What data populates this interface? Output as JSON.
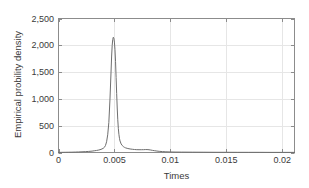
{
  "chart_data": {
    "type": "line",
    "title": "",
    "xlabel": "Times",
    "ylabel": "Empirical probility density",
    "xlim": [
      0,
      0.0211
    ],
    "ylim": [
      0,
      2500
    ],
    "xticks": [
      0,
      0.005,
      0.01,
      0.015,
      0.02
    ],
    "xticklabels": [
      "0",
      "0.005",
      "0.01",
      "0.015",
      "0.02"
    ],
    "yticks": [
      0,
      500,
      1000,
      1500,
      2000,
      2500
    ],
    "yticklabels": [
      "0",
      "500",
      "1,000",
      "1,500",
      "2,000",
      "2,500"
    ],
    "grid": true,
    "legend": null,
    "line_color": "#6e6e6e",
    "grid_color": "#e6e6e6",
    "axis_color": "#8c8c8c",
    "text_color": "#3a3a3a",
    "background": "#ffffff",
    "series": [
      {
        "name": "empirical density",
        "x": [
          0.0,
          0.0003,
          0.0006,
          0.0009,
          0.0012,
          0.0015,
          0.0018,
          0.0021,
          0.0024,
          0.0027,
          0.003,
          0.0032,
          0.0034,
          0.0036,
          0.0038,
          0.004,
          0.0041,
          0.0042,
          0.0043,
          0.0044,
          0.0045,
          0.0046,
          0.0047,
          0.00475,
          0.0048,
          0.00485,
          0.0049,
          0.00495,
          0.005,
          0.00505,
          0.0051,
          0.00515,
          0.0052,
          0.00525,
          0.0053,
          0.00535,
          0.0054,
          0.00545,
          0.0055,
          0.0056,
          0.0057,
          0.0058,
          0.0059,
          0.006,
          0.0062,
          0.0064,
          0.0066,
          0.0068,
          0.007,
          0.0072,
          0.0074,
          0.0076,
          0.0078,
          0.008,
          0.0082,
          0.0084,
          0.0086,
          0.0088,
          0.009,
          0.0093,
          0.0096,
          0.01,
          0.0105,
          0.011,
          0.012,
          0.013,
          0.014,
          0.015,
          0.016,
          0.017,
          0.018,
          0.019,
          0.02,
          0.0211
        ],
        "y": [
          2,
          3,
          4,
          5,
          6,
          8,
          10,
          13,
          16,
          20,
          26,
          32,
          38,
          46,
          58,
          78,
          96,
          130,
          200,
          330,
          560,
          980,
          1520,
          1800,
          2000,
          2110,
          2150,
          2130,
          2060,
          1920,
          1700,
          1400,
          1100,
          830,
          610,
          450,
          340,
          265,
          215,
          160,
          130,
          110,
          96,
          86,
          74,
          66,
          60,
          56,
          53,
          52,
          52,
          53,
          55,
          54,
          48,
          40,
          33,
          27,
          22,
          17,
          13,
          10,
          8,
          7,
          6,
          5,
          4,
          4,
          3,
          3,
          3,
          2,
          2,
          2
        ]
      }
    ]
  }
}
